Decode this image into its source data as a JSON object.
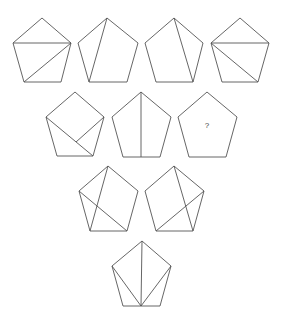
{
  "puzzle": {
    "stroke_color": "#555555",
    "background": "#ffffff",
    "pentagons": [
      {
        "id": "p1",
        "row": 1,
        "vertices": [
          [
            42,
            18
          ],
          [
            71,
            43
          ],
          [
            61,
            82
          ],
          [
            24,
            82
          ],
          [
            13,
            43
          ]
        ],
        "lines": [
          [
            [
              13,
              43
            ],
            [
              71,
              43
            ]
          ],
          [
            [
              71,
              43
            ],
            [
              24,
              82
            ]
          ]
        ],
        "label": ""
      },
      {
        "id": "p2",
        "row": 1,
        "vertices": [
          [
            107,
            18
          ],
          [
            138,
            43
          ],
          [
            127,
            82
          ],
          [
            89,
            82
          ],
          [
            78,
            43
          ]
        ],
        "lines": [
          [
            [
              107,
              18
            ],
            [
              89,
              82
            ]
          ]
        ],
        "label": ""
      },
      {
        "id": "p3",
        "row": 1,
        "vertices": [
          [
            174,
            18
          ],
          [
            203,
            43
          ],
          [
            193,
            82
          ],
          [
            156,
            82
          ],
          [
            145,
            43
          ]
        ],
        "lines": [
          [
            [
              174,
              18
            ],
            [
              193,
              82
            ]
          ]
        ],
        "label": ""
      },
      {
        "id": "p4",
        "row": 1,
        "vertices": [
          [
            240,
            18
          ],
          [
            269,
            43
          ],
          [
            258,
            82
          ],
          [
            222,
            82
          ],
          [
            211,
            43
          ]
        ],
        "lines": [
          [
            [
              211,
              43
            ],
            [
              269,
              43
            ]
          ],
          [
            [
              211,
              43
            ],
            [
              258,
              82
            ]
          ]
        ],
        "label": ""
      },
      {
        "id": "p5",
        "row": 2,
        "vertices": [
          [
            75,
            92
          ],
          [
            104,
            117
          ],
          [
            93,
            156
          ],
          [
            57,
            156
          ],
          [
            46,
            117
          ]
        ],
        "lines": [
          [
            [
              46,
              117
            ],
            [
              93,
              156
            ]
          ],
          [
            [
              104,
              117
            ],
            [
              76,
              142
            ]
          ]
        ],
        "label": ""
      },
      {
        "id": "p6",
        "row": 2,
        "vertices": [
          [
            141,
            92
          ],
          [
            171,
            117
          ],
          [
            160,
            157
          ],
          [
            123,
            157
          ],
          [
            112,
            117
          ]
        ],
        "lines": [
          [
            [
              141,
              92
            ],
            [
              141,
              157
            ]
          ]
        ],
        "label": ""
      },
      {
        "id": "p7",
        "row": 2,
        "vertices": [
          [
            207,
            92
          ],
          [
            237,
            117
          ],
          [
            226,
            157
          ],
          [
            189,
            157
          ],
          [
            178,
            117
          ]
        ],
        "lines": [],
        "label": "?"
      },
      {
        "id": "p8",
        "row": 3,
        "vertices": [
          [
            108,
            166
          ],
          [
            138,
            191
          ],
          [
            127,
            231
          ],
          [
            90,
            231
          ],
          [
            79,
            191
          ]
        ],
        "lines": [
          [
            [
              108,
              166
            ],
            [
              90,
              231
            ]
          ],
          [
            [
              79,
              191
            ],
            [
              127,
              231
            ]
          ]
        ],
        "label": ""
      },
      {
        "id": "p9",
        "row": 3,
        "vertices": [
          [
            174,
            166
          ],
          [
            204,
            191
          ],
          [
            193,
            231
          ],
          [
            156,
            231
          ],
          [
            145,
            191
          ]
        ],
        "lines": [
          [
            [
              174,
              166
            ],
            [
              193,
              231
            ]
          ],
          [
            [
              204,
              191
            ],
            [
              156,
              231
            ]
          ]
        ],
        "label": ""
      },
      {
        "id": "p10",
        "row": 4,
        "vertices": [
          [
            142,
            241
          ],
          [
            171,
            266
          ],
          [
            160,
            306
          ],
          [
            123,
            306
          ],
          [
            112,
            266
          ]
        ],
        "lines": [
          [
            [
              141,
              306
            ],
            [
              142,
              241
            ]
          ],
          [
            [
              141,
              306
            ],
            [
              112,
              266
            ]
          ],
          [
            [
              141,
              306
            ],
            [
              171,
              266
            ]
          ]
        ],
        "label": ""
      }
    ],
    "question_mark": {
      "text": "?",
      "x": 207,
      "y": 128
    }
  }
}
